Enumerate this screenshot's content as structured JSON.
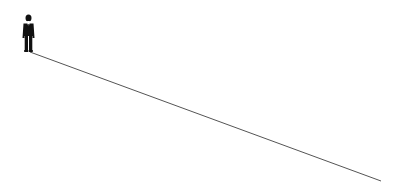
{
  "scene": {
    "description": "Businessman standing at the start of a long descending line",
    "figure": {
      "icon": "businessman-silhouette-icon",
      "color": "#111111"
    },
    "line": {
      "color": "#555555",
      "start": [
        30,
        52
      ],
      "end": [
        381,
        181
      ]
    },
    "background": "#ffffff"
  }
}
